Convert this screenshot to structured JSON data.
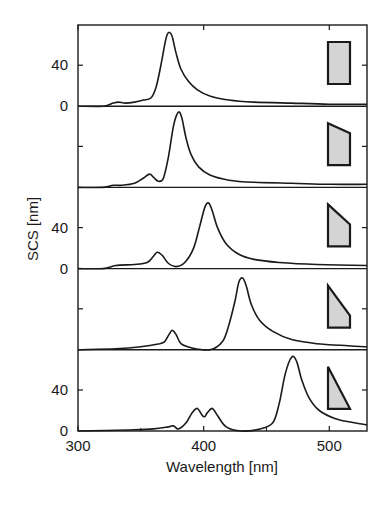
{
  "chart_data": {
    "type": "line",
    "title": "",
    "xlabel": "Wavelength [nm]",
    "ylabel": "SCS [nm]",
    "xlim": [
      300,
      530
    ],
    "x_ticks": [
      300,
      400,
      500
    ],
    "x_tick_labels": [
      "300",
      "400",
      "500"
    ],
    "panel_ylim": [
      0,
      80
    ],
    "y_tick_labels": [
      {
        "panel": 0,
        "value": 40,
        "label": "40"
      },
      {
        "panel": 0,
        "value": 0,
        "label": "0"
      },
      {
        "panel": 2,
        "value": 40,
        "label": "40"
      },
      {
        "panel": 2,
        "value": 0,
        "label": "0"
      },
      {
        "panel": 4,
        "value": 40,
        "label": "40"
      },
      {
        "panel": 4,
        "value": 0,
        "label": "0"
      }
    ],
    "grid": false,
    "legend": "none (each panel has an inset gray shape icon showing particle cross-section)",
    "layout": "5 vertically stacked panels sharing x-axis",
    "series": [
      {
        "name": "rectangle",
        "shape": "rectangle",
        "x": [
          300,
          320,
          328,
          332,
          338,
          345,
          352,
          358,
          362,
          366,
          369,
          371,
          373,
          375,
          378,
          382,
          388,
          395,
          405,
          420,
          440,
          470,
          500,
          530
        ],
        "values": [
          0,
          0,
          3,
          4,
          3,
          4,
          6,
          8,
          18,
          40,
          60,
          70,
          72,
          68,
          52,
          36,
          24,
          16,
          10,
          6,
          4,
          3,
          2,
          2
        ]
      },
      {
        "name": "slanted-top",
        "shape": "trapezoid-slight",
        "x": [
          300,
          320,
          328,
          335,
          345,
          352,
          357,
          360,
          364,
          368,
          372,
          376,
          379,
          381,
          383,
          386,
          390,
          396,
          405,
          420,
          440,
          470,
          500,
          530
        ],
        "values": [
          0,
          0,
          2,
          2,
          4,
          9,
          13,
          10,
          6,
          9,
          30,
          60,
          72,
          73,
          66,
          48,
          32,
          20,
          12,
          7,
          5,
          4,
          3,
          3
        ]
      },
      {
        "name": "steeper-slant",
        "shape": "trapezoid-medium",
        "x": [
          300,
          320,
          330,
          345,
          355,
          360,
          363,
          367,
          372,
          378,
          385,
          392,
          397,
          401,
          404,
          407,
          411,
          418,
          428,
          440,
          460,
          490,
          530
        ],
        "values": [
          0,
          0,
          3,
          4,
          6,
          12,
          16,
          13,
          5,
          2,
          6,
          20,
          42,
          60,
          64,
          56,
          40,
          24,
          14,
          9,
          6,
          4,
          3
        ]
      },
      {
        "name": "near-triangle",
        "shape": "trapezoid-steep",
        "x": [
          300,
          330,
          350,
          365,
          369,
          372,
          375,
          378,
          382,
          390,
          405,
          415,
          420,
          425,
          428,
          431,
          434,
          438,
          445,
          455,
          470,
          490,
          515,
          530
        ],
        "values": [
          0,
          1,
          3,
          6,
          8,
          14,
          19,
          15,
          6,
          2,
          0,
          8,
          24,
          48,
          66,
          70,
          62,
          44,
          28,
          18,
          10,
          6,
          4,
          3
        ]
      },
      {
        "name": "triangle",
        "shape": "triangle",
        "x": [
          300,
          340,
          360,
          372,
          376,
          380,
          386,
          391,
          395,
          399,
          401,
          403,
          407,
          411,
          418,
          430,
          445,
          455,
          460,
          465,
          470,
          474,
          478,
          484,
          492,
          505,
          520,
          530
        ],
        "values": [
          0,
          1,
          2,
          4,
          5,
          2,
          8,
          18,
          22,
          15,
          14,
          18,
          22,
          15,
          4,
          0,
          2,
          8,
          26,
          56,
          72,
          68,
          50,
          32,
          20,
          12,
          8,
          6
        ]
      }
    ]
  },
  "figure": {
    "panel_count": 5,
    "shape_fill": "#d4d4d4",
    "line_color": "#1a1a1a"
  }
}
